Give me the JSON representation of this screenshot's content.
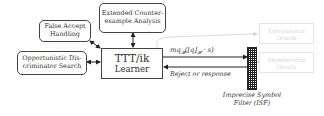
{
  "diagram": {
    "nodes": {
      "false_accept": {
        "line1": "False Accept",
        "line2": "Handling"
      },
      "counterexample": {
        "line1": "Extended Counter-",
        "line2": "example Analysis"
      },
      "discriminator": {
        "line1": "Opportunistic Dis-",
        "line2": "criminator Search"
      },
      "learner": {
        "line1": "TTT/ik",
        "line2": "Learner"
      },
      "equivalence_oracle": {
        "line1": "Equivalence",
        "line2": "Oracle"
      },
      "membership_oracle": {
        "line1": "Membership",
        "line2": "Oracle"
      },
      "isf": {
        "line1": "Imprecise Symbol",
        "line2": "Filter (ISF)"
      }
    },
    "edges": {
      "query_label": "mq",
      "query_sub": "𝓗",
      "query_rest": "(⌊q⌋",
      "query_sub2": "𝓗",
      "query_tail": " · s)",
      "response_label": "Reject or response"
    },
    "colors": {
      "stroke": "#444444",
      "faded": "#e0e0e0",
      "text": "#333333"
    }
  }
}
